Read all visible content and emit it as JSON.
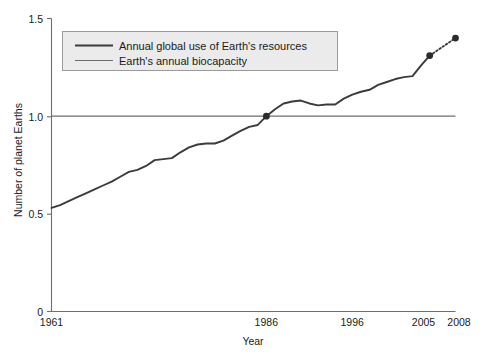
{
  "chart_data": {
    "type": "line",
    "title": "",
    "xlabel": "Year",
    "ylabel": "Number of planet Earths",
    "xlim": [
      1961,
      2008
    ],
    "ylim": [
      0,
      1.5
    ],
    "xticks": [
      "1961",
      "1986",
      "1996",
      "2005",
      "2008"
    ],
    "xtick_values": [
      1961,
      1986,
      1996,
      2005,
      2008
    ],
    "yticks": [
      "0",
      "0.5",
      "1.0",
      "1.5"
    ],
    "ytick_values": [
      0,
      0.5,
      1.0,
      1.5
    ],
    "grid": false,
    "legend_position": "upper-left-inside",
    "series": [
      {
        "name": "Annual global use of Earth's resources",
        "color": "#3b3b3b",
        "style": "solid",
        "x": [
          1961,
          1962,
          1963,
          1964,
          1965,
          1966,
          1967,
          1968,
          1969,
          1970,
          1971,
          1972,
          1973,
          1974,
          1975,
          1976,
          1977,
          1978,
          1979,
          1980,
          1981,
          1982,
          1983,
          1984,
          1985,
          1986,
          1987,
          1988,
          1989,
          1990,
          1991,
          1992,
          1993,
          1994,
          1995,
          1996,
          1997,
          1998,
          1999,
          2000,
          2001,
          2002,
          2003,
          2004,
          2005
        ],
        "values": [
          0.53,
          0.545,
          0.565,
          0.585,
          0.605,
          0.625,
          0.645,
          0.665,
          0.69,
          0.715,
          0.725,
          0.745,
          0.775,
          0.78,
          0.785,
          0.815,
          0.84,
          0.855,
          0.86,
          0.86,
          0.875,
          0.9,
          0.925,
          0.945,
          0.955,
          1.0,
          1.035,
          1.065,
          1.075,
          1.08,
          1.065,
          1.055,
          1.06,
          1.06,
          1.09,
          1.11,
          1.125,
          1.135,
          1.16,
          1.175,
          1.19,
          1.2,
          1.205,
          1.26,
          1.31
        ]
      },
      {
        "name": "Earth's annual biocapacity",
        "color": "#6e6e6e",
        "style": "solid",
        "x": [
          1961,
          2008
        ],
        "values": [
          1.0,
          1.0
        ]
      }
    ],
    "projection": {
      "name": "projected",
      "style": "dotted",
      "color": "#3b3b3b",
      "x": [
        2005,
        2008
      ],
      "values": [
        1.31,
        1.4
      ]
    },
    "markers": [
      {
        "label": "1986-crossing",
        "x": 1986,
        "y": 1.0
      },
      {
        "label": "2005-value",
        "x": 2005,
        "y": 1.31
      },
      {
        "label": "2008-projection",
        "x": 2008,
        "y": 1.4
      }
    ],
    "legend_entries": [
      "Annual global use of Earth's resources",
      "Earth's annual biocapacity"
    ],
    "colors": {
      "series_main": "#3b3b3b",
      "series_biocapacity": "#6e6e6e",
      "axis": "#6e6e6e",
      "text": "#1a1a1a",
      "legend_background": "#ebebeb",
      "legend_border": "#9a9a9a",
      "background": "#ffffff"
    }
  }
}
